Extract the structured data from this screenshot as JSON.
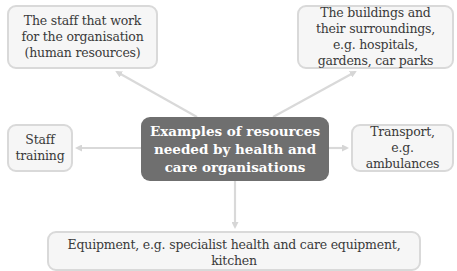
{
  "diagram": {
    "type": "mind-map",
    "center": {
      "label": "Examples of resources needed by health and care organisations"
    },
    "nodes": [
      {
        "id": "staff",
        "label": "The staff that work for the organisation (human resources)"
      },
      {
        "id": "buildings",
        "label": "The buildings and their surroundings, e.g. hospitals, gardens, car parks"
      },
      {
        "id": "training",
        "label": "Staff training"
      },
      {
        "id": "transport",
        "label": "Transport, e.g. ambulances"
      },
      {
        "id": "equipment",
        "label": "Equipment, e.g. specialist health and care equipment, kitchen"
      }
    ],
    "edges": [
      {
        "from": "center",
        "to": "staff"
      },
      {
        "from": "center",
        "to": "buildings"
      },
      {
        "from": "center",
        "to": "training"
      },
      {
        "from": "center",
        "to": "transport"
      },
      {
        "from": "center",
        "to": "equipment"
      }
    ],
    "colors": {
      "center_fill": "#6f6f6f",
      "center_text": "#ffffff",
      "node_fill": "#f6f6f6",
      "node_border": "#d9d9d9",
      "node_text": "#3a3a3a",
      "arrow": "#d6d6d6"
    }
  }
}
